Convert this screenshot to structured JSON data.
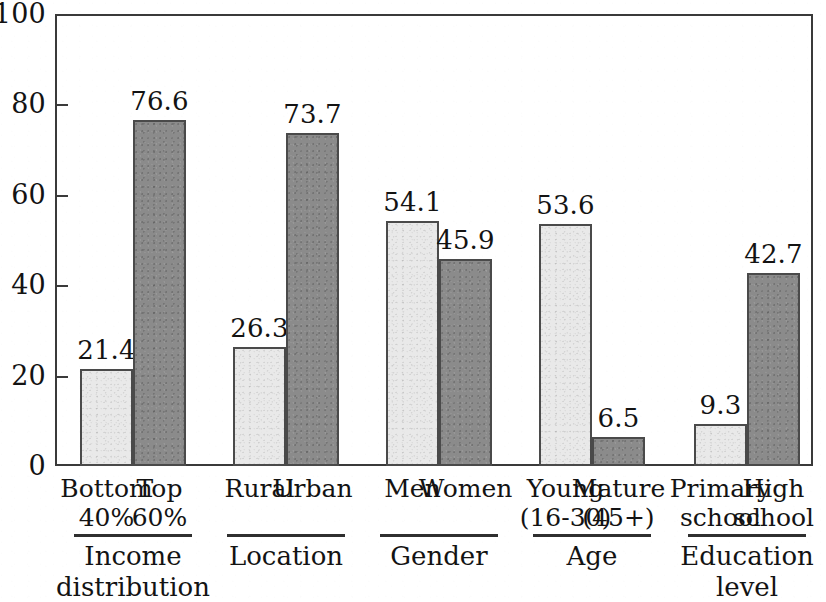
{
  "chart_data": {
    "type": "bar",
    "title": "",
    "subtitle": "",
    "xlabel": "",
    "ylabel": "",
    "ylim": [
      0,
      100
    ],
    "yticks": [
      "0",
      "20",
      "40",
      "60",
      "80",
      "100"
    ],
    "grid": false,
    "legend": "none",
    "orientation": "vertical",
    "groups": [
      {
        "group_label_line1": "Income",
        "group_label_line2": "distribution",
        "bars": [
          {
            "category_line1": "Bottom",
            "category_line2": "40%",
            "value": 21.4,
            "value_label": "21.4",
            "style": "light"
          },
          {
            "category_line1": "Top",
            "category_line2": "60%",
            "value": 76.6,
            "value_label": "76.6",
            "style": "dark"
          }
        ]
      },
      {
        "group_label_line1": "Location",
        "group_label_line2": "",
        "bars": [
          {
            "category_line1": "Rural",
            "category_line2": "",
            "value": 26.3,
            "value_label": "26.3",
            "style": "light"
          },
          {
            "category_line1": "Urban",
            "category_line2": "",
            "value": 73.7,
            "value_label": "73.7",
            "style": "dark"
          }
        ]
      },
      {
        "group_label_line1": "Gender",
        "group_label_line2": "",
        "bars": [
          {
            "category_line1": "Men",
            "category_line2": "",
            "value": 54.1,
            "value_label": "54.1",
            "style": "light"
          },
          {
            "category_line1": "Women",
            "category_line2": "",
            "value": 45.9,
            "value_label": "45.9",
            "style": "dark"
          }
        ]
      },
      {
        "group_label_line1": "Age",
        "group_label_line2": "",
        "bars": [
          {
            "category_line1": "Young",
            "category_line2": "(16-30)",
            "value": 53.6,
            "value_label": "53.6",
            "style": "light"
          },
          {
            "category_line1": "Mature",
            "category_line2": "(45+)",
            "value": 6.5,
            "value_label": "6.5",
            "style": "dark"
          }
        ]
      },
      {
        "group_label_line1": "Education",
        "group_label_line2": "level",
        "bars": [
          {
            "category_line1": "Primary",
            "category_line2": "school",
            "value": 9.3,
            "value_label": "9.3",
            "style": "light"
          },
          {
            "category_line1": "High",
            "category_line2": "school",
            "value": 42.7,
            "value_label": "42.7",
            "style": "dark"
          }
        ]
      }
    ],
    "colors": {
      "light_bar_fill": "#e9e9e9",
      "dark_bar_fill": "#8b8b8b",
      "bar_outline": "#4a4a4a",
      "axis": "#3a3a3a",
      "text": "#131313",
      "background": "#ffffff"
    }
  }
}
